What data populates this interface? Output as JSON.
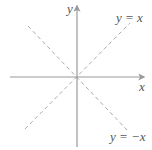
{
  "diagram": {
    "title": "",
    "axes": {
      "x_label": "x",
      "y_label": "y",
      "color": "#9a9a9a"
    },
    "lines": [
      {
        "name": "identity",
        "label": "y = x",
        "slope": 1,
        "style": "dashed",
        "color": "#aaaaaa"
      },
      {
        "name": "negative-identity",
        "label": "y = −x",
        "slope": -1,
        "style": "dashed",
        "color": "#aaaaaa"
      }
    ]
  }
}
